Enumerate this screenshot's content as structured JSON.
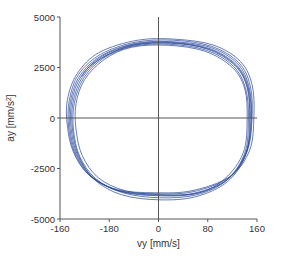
{
  "chart_data": {
    "type": "line",
    "subtype": "phase-portrait",
    "title": "",
    "xlabel": "vy [mm/s]",
    "ylabel": "ay [mm/s²]",
    "ylabel_parts": {
      "base": "ay [mm/s",
      "sup": "2",
      "end": "]"
    },
    "xlim": [
      -160,
      160
    ],
    "ylim": [
      -5000,
      5000
    ],
    "x_ticks": [
      {
        "value": -160,
        "label": "-160"
      },
      {
        "value": -80,
        "label": "-180"
      },
      {
        "value": 0,
        "label": "0"
      },
      {
        "value": 80,
        "label": "80"
      },
      {
        "value": 160,
        "label": "160"
      }
    ],
    "y_ticks": [
      {
        "value": 5000,
        "label": "5000"
      },
      {
        "value": 2500,
        "label": "2500"
      },
      {
        "value": 0,
        "label": "0"
      },
      {
        "value": -2500,
        "label": "-2500"
      },
      {
        "value": -5000,
        "label": "-5000"
      }
    ],
    "grid": false,
    "zero_lines": true,
    "legend": null,
    "line_color": "#2b4a9b",
    "axis_color": "#555555",
    "series": [
      {
        "name": "cycle-1",
        "points": [
          [
            150,
            0
          ],
          [
            146,
            1500
          ],
          [
            126,
            2650
          ],
          [
            82,
            3450
          ],
          [
            20,
            3750
          ],
          [
            -40,
            3650
          ],
          [
            -92,
            3050
          ],
          [
            -126,
            2050
          ],
          [
            -141,
            800
          ],
          [
            -142,
            -500
          ],
          [
            -132,
            -1800
          ],
          [
            -106,
            -2950
          ],
          [
            -60,
            -3650
          ],
          [
            0,
            -3850
          ],
          [
            60,
            -3750
          ],
          [
            112,
            -3050
          ],
          [
            142,
            -1700
          ],
          [
            150,
            0
          ]
        ]
      },
      {
        "name": "cycle-2",
        "points": [
          [
            146,
            -100
          ],
          [
            142,
            1400
          ],
          [
            122,
            2550
          ],
          [
            78,
            3350
          ],
          [
            18,
            3650
          ],
          [
            -42,
            3550
          ],
          [
            -90,
            2950
          ],
          [
            -122,
            1950
          ],
          [
            -137,
            700
          ],
          [
            -138,
            -600
          ],
          [
            -128,
            -1900
          ],
          [
            -102,
            -3000
          ],
          [
            -58,
            -3700
          ],
          [
            2,
            -3950
          ],
          [
            62,
            -3800
          ],
          [
            110,
            -3100
          ],
          [
            140,
            -1750
          ],
          [
            146,
            -100
          ]
        ]
      },
      {
        "name": "cycle-3",
        "points": [
          [
            152,
            50
          ],
          [
            149,
            1600
          ],
          [
            130,
            2750
          ],
          [
            86,
            3550
          ],
          [
            24,
            3850
          ],
          [
            -38,
            3750
          ],
          [
            -94,
            3150
          ],
          [
            -130,
            2150
          ],
          [
            -145,
            850
          ],
          [
            -146,
            -450
          ],
          [
            -136,
            -1750
          ],
          [
            -110,
            -2900
          ],
          [
            -64,
            -3600
          ],
          [
            -4,
            -3750
          ],
          [
            56,
            -3650
          ],
          [
            114,
            -2950
          ],
          [
            144,
            -1650
          ],
          [
            152,
            50
          ]
        ]
      },
      {
        "name": "cycle-4",
        "points": [
          [
            144,
            0
          ],
          [
            140,
            1450
          ],
          [
            120,
            2500
          ],
          [
            76,
            3300
          ],
          [
            16,
            3600
          ],
          [
            -44,
            3500
          ],
          [
            -88,
            2900
          ],
          [
            -120,
            1900
          ],
          [
            -134,
            700
          ],
          [
            -134,
            -550
          ],
          [
            -124,
            -1850
          ],
          [
            -98,
            -2950
          ],
          [
            -54,
            -3600
          ],
          [
            6,
            -3800
          ],
          [
            66,
            -3700
          ],
          [
            108,
            -3000
          ],
          [
            138,
            -1700
          ],
          [
            144,
            0
          ]
        ]
      },
      {
        "name": "cycle-5",
        "points": [
          [
            155,
            100
          ],
          [
            152,
            1650
          ],
          [
            133,
            2800
          ],
          [
            90,
            3600
          ],
          [
            28,
            3900
          ],
          [
            -34,
            3850
          ],
          [
            -96,
            3250
          ],
          [
            -132,
            2200
          ],
          [
            -148,
            900
          ],
          [
            -148,
            -400
          ],
          [
            -138,
            -1700
          ],
          [
            -112,
            -2850
          ],
          [
            -66,
            -3550
          ],
          [
            -6,
            -3700
          ],
          [
            54,
            -3600
          ],
          [
            116,
            -2900
          ],
          [
            148,
            -1600
          ],
          [
            155,
            100
          ]
        ]
      },
      {
        "name": "cycle-6",
        "points": [
          [
            148,
            -50
          ],
          [
            144,
            1500
          ],
          [
            124,
            2600
          ],
          [
            80,
            3400
          ],
          [
            22,
            3700
          ],
          [
            -40,
            3600
          ],
          [
            -91,
            3000
          ],
          [
            -124,
            2000
          ],
          [
            -139,
            750
          ],
          [
            -140,
            -500
          ],
          [
            -130,
            -1850
          ],
          [
            -104,
            -3050
          ],
          [
            -60,
            -3800
          ],
          [
            0,
            -4050
          ],
          [
            60,
            -3900
          ],
          [
            112,
            -3150
          ],
          [
            142,
            -1800
          ],
          [
            148,
            -50
          ]
        ]
      },
      {
        "name": "cycle-7",
        "points": [
          [
            151,
            0
          ],
          [
            147,
            1550
          ],
          [
            128,
            2700
          ],
          [
            84,
            3500
          ],
          [
            20,
            3780
          ],
          [
            -40,
            3680
          ],
          [
            -93,
            3080
          ],
          [
            -128,
            2080
          ],
          [
            -143,
            820
          ],
          [
            -144,
            -480
          ],
          [
            -134,
            -1780
          ],
          [
            -108,
            -2920
          ],
          [
            -62,
            -3620
          ],
          [
            -2,
            -3820
          ],
          [
            58,
            -3720
          ],
          [
            113,
            -3020
          ],
          [
            143,
            -1680
          ],
          [
            151,
            0
          ]
        ]
      },
      {
        "name": "cycle-8-tail",
        "points": [
          [
            149,
            0
          ],
          [
            145,
            1480
          ],
          [
            125,
            2620
          ],
          [
            81,
            3420
          ],
          [
            20,
            3720
          ],
          [
            -40,
            3620
          ],
          [
            -84,
            3100
          ],
          [
            -112,
            2550
          ],
          [
            -125,
            2050
          ]
        ]
      }
    ]
  }
}
